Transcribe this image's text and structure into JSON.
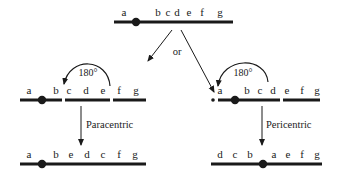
{
  "diagram": {
    "type": "chromosome-inversion",
    "colors": {
      "ink": "#1a1a1a",
      "background": "#ffffff"
    },
    "original": {
      "genes": [
        "a",
        "b",
        "c",
        "d",
        "e",
        "f",
        "g"
      ],
      "gene_x": [
        124,
        158,
        168,
        177,
        189,
        202,
        220
      ],
      "centromere_after": "a"
    },
    "branch_label": "or",
    "paracentric": {
      "before": {
        "genes": [
          "a",
          "b",
          "c",
          "d",
          "e",
          "f",
          "g"
        ],
        "gene_x": [
          29,
          55,
          69,
          86,
          103,
          119,
          136
        ]
      },
      "rotation_label": "180°",
      "arrow_label": "Paracentric",
      "after": {
        "genes": [
          "a",
          "b",
          "e",
          "d",
          "c",
          "f",
          "g"
        ],
        "gene_x": [
          29,
          55,
          71,
          87,
          103,
          119,
          135
        ]
      }
    },
    "pericentric": {
      "before": {
        "genes": [
          "a",
          "b",
          "c",
          "d",
          "e",
          "f",
          "g"
        ],
        "gene_x": [
          220,
          246,
          259,
          273,
          287,
          302,
          317
        ]
      },
      "rotation_label": "180°",
      "arrow_label": "Pericentric",
      "after": {
        "genes": [
          "d",
          "c",
          "b",
          "a",
          "e",
          "f",
          "g"
        ],
        "gene_x": [
          219,
          235,
          249,
          274,
          288,
          302,
          317
        ]
      }
    }
  }
}
